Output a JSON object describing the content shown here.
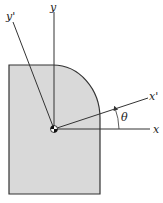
{
  "diagram": {
    "type": "cross-section-with-rotated-axes",
    "labels": {
      "y_axis": "y",
      "x_axis": "x",
      "x_prime_axis": "x'",
      "y_prime_axis": "y'",
      "angle": "θ"
    },
    "colors": {
      "fill": "#d9d9d9",
      "stroke": "#333333",
      "axis": "#333333"
    }
  }
}
